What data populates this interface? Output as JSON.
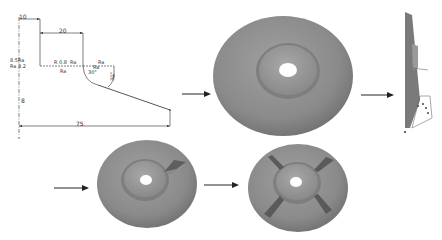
{
  "profile_drawing": {
    "dimensions": {
      "top_small": "10",
      "top_width": "20",
      "bottom_width": "75",
      "left_height": "8",
      "angle_a": "30°",
      "angle_b": "30°"
    },
    "annotations": {
      "left_upper_1": "8.5Ra",
      "left_upper_2": "Ra 3.2",
      "mid_1": "R 0.8",
      "mid_2": "Ra",
      "mid_under": "Ra",
      "right_1": "Ra",
      "right_2": "Ra"
    }
  },
  "steps": [
    {
      "name": "profile-sketch"
    },
    {
      "name": "revolved-disc"
    },
    {
      "name": "side-view"
    },
    {
      "name": "disc-one-rib"
    },
    {
      "name": "disc-four-ribs"
    }
  ],
  "colors": {
    "line": "#2a2a2a",
    "disc_face": "#8c8c8c",
    "disc_light": "#a6a6a6",
    "disc_dark": "#6e6e6e",
    "background": "#ffffff"
  }
}
